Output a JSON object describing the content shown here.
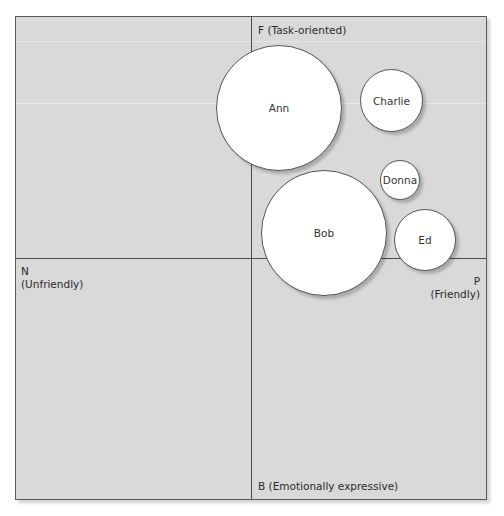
{
  "diagram": {
    "type": "social-style-quadrant",
    "axes": {
      "top": "F (Task-oriented)",
      "bottom": "B (Emotionally expressive)",
      "left_letter": "N",
      "left_desc": "(Unfriendly)",
      "right_letter": "P",
      "right_desc": "(Friendly)"
    },
    "colors": {
      "background": "#d9d9d9",
      "axis_line": "#4a4a4a",
      "bubble_fill": "#ffffff",
      "bubble_border": "#555555",
      "text": "#2a2a2a"
    },
    "bubbles": [
      {
        "name": "Ann",
        "cx": 279,
        "cy": 108,
        "r": 63
      },
      {
        "name": "Charlie",
        "cx": 391,
        "cy": 101,
        "r": 32
      },
      {
        "name": "Donna",
        "cx": 400,
        "cy": 180,
        "r": 20
      },
      {
        "name": "Bob",
        "cx": 324,
        "cy": 233,
        "r": 63
      },
      {
        "name": "Ed",
        "cx": 425,
        "cy": 240,
        "r": 31
      }
    ]
  }
}
